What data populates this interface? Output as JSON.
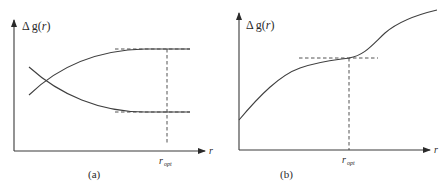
{
  "figure": {
    "panels": [
      {
        "id": "a",
        "caption": "(a)",
        "y_axis_label": "Δg(r)",
        "y_axis_prefix": "Δ",
        "y_axis_func": "g(",
        "y_axis_var": "r",
        "y_axis_close": ")",
        "x_axis_label": "r",
        "marker_label_main": "r",
        "marker_label_sub": "opt",
        "description": "Two curves crossing near the y-axis: one increasing to an upper plateau, one decreasing to a lower plateau; dashed asymptote lines at both plateaus and a vertical dashed line at r_opt."
      },
      {
        "id": "b",
        "caption": "(b)",
        "y_axis_label": "Δg(r)",
        "y_axis_prefix": "Δ",
        "y_axis_func": "g(",
        "y_axis_var": "r",
        "y_axis_close": ")",
        "x_axis_label": "r",
        "marker_label_main": "r",
        "marker_label_sub": "opt",
        "description": "Single monotonically increasing curve with an inflection plateau at r_opt; dashed horizontal tangent line and vertical dashed line at r_opt."
      }
    ]
  },
  "colors": {
    "line": "#3f3f3f",
    "axis": "#3a3a3a",
    "text": "#2a2a2a",
    "background": "#ffffff"
  }
}
